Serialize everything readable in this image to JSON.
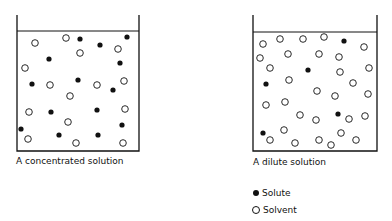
{
  "figure": {
    "beakers": [
      {
        "label": "A concentrated solution",
        "frame": {
          "left": 17,
          "right": 139,
          "top": 15,
          "liquid_top": 31,
          "bottom": 151
        },
        "particles": [
          {
            "x": 35,
            "y": 43,
            "type": "solvent"
          },
          {
            "x": 66,
            "y": 38,
            "type": "solvent"
          },
          {
            "x": 80,
            "y": 39,
            "type": "solute"
          },
          {
            "x": 100,
            "y": 45,
            "type": "solute"
          },
          {
            "x": 127,
            "y": 37,
            "type": "solute"
          },
          {
            "x": 118,
            "y": 49,
            "type": "solvent"
          },
          {
            "x": 80,
            "y": 53,
            "type": "solvent"
          },
          {
            "x": 49,
            "y": 59,
            "type": "solute"
          },
          {
            "x": 120,
            "y": 63,
            "type": "solute"
          },
          {
            "x": 25,
            "y": 68,
            "type": "solvent"
          },
          {
            "x": 32,
            "y": 84,
            "type": "solute"
          },
          {
            "x": 50,
            "y": 85,
            "type": "solvent"
          },
          {
            "x": 78,
            "y": 80,
            "type": "solute"
          },
          {
            "x": 97,
            "y": 85,
            "type": "solvent"
          },
          {
            "x": 113,
            "y": 90,
            "type": "solute"
          },
          {
            "x": 124,
            "y": 81,
            "type": "solvent"
          },
          {
            "x": 70,
            "y": 96,
            "type": "solvent"
          },
          {
            "x": 29,
            "y": 112,
            "type": "solvent"
          },
          {
            "x": 51,
            "y": 112,
            "type": "solute"
          },
          {
            "x": 97,
            "y": 110,
            "type": "solute"
          },
          {
            "x": 125,
            "y": 109,
            "type": "solvent"
          },
          {
            "x": 68,
            "y": 122,
            "type": "solvent"
          },
          {
            "x": 21,
            "y": 129,
            "type": "solute"
          },
          {
            "x": 122,
            "y": 125,
            "type": "solute"
          },
          {
            "x": 28,
            "y": 139,
            "type": "solvent"
          },
          {
            "x": 59,
            "y": 135,
            "type": "solute"
          },
          {
            "x": 76,
            "y": 143,
            "type": "solvent"
          },
          {
            "x": 98,
            "y": 135,
            "type": "solute"
          },
          {
            "x": 123,
            "y": 143,
            "type": "solvent"
          }
        ]
      },
      {
        "label": "A dilute solution",
        "frame": {
          "left": 253,
          "right": 377,
          "top": 15,
          "liquid_top": 32,
          "bottom": 151
        },
        "particles": [
          {
            "x": 263,
            "y": 44,
            "type": "solvent"
          },
          {
            "x": 280,
            "y": 39,
            "type": "solvent"
          },
          {
            "x": 303,
            "y": 39,
            "type": "solvent"
          },
          {
            "x": 324,
            "y": 37,
            "type": "solvent"
          },
          {
            "x": 344,
            "y": 41,
            "type": "solute"
          },
          {
            "x": 364,
            "y": 47,
            "type": "solvent"
          },
          {
            "x": 260,
            "y": 58,
            "type": "solvent"
          },
          {
            "x": 288,
            "y": 54,
            "type": "solvent"
          },
          {
            "x": 319,
            "y": 54,
            "type": "solvent"
          },
          {
            "x": 339,
            "y": 57,
            "type": "solvent"
          },
          {
            "x": 270,
            "y": 68,
            "type": "solvent"
          },
          {
            "x": 308,
            "y": 70,
            "type": "solute"
          },
          {
            "x": 340,
            "y": 72,
            "type": "solvent"
          },
          {
            "x": 369,
            "y": 68,
            "type": "solvent"
          },
          {
            "x": 266,
            "y": 84,
            "type": "solute"
          },
          {
            "x": 289,
            "y": 80,
            "type": "solvent"
          },
          {
            "x": 353,
            "y": 83,
            "type": "solvent"
          },
          {
            "x": 317,
            "y": 91,
            "type": "solvent"
          },
          {
            "x": 335,
            "y": 96,
            "type": "solvent"
          },
          {
            "x": 368,
            "y": 94,
            "type": "solvent"
          },
          {
            "x": 266,
            "y": 105,
            "type": "solvent"
          },
          {
            "x": 285,
            "y": 102,
            "type": "solvent"
          },
          {
            "x": 300,
            "y": 115,
            "type": "solvent"
          },
          {
            "x": 338,
            "y": 114,
            "type": "solute"
          },
          {
            "x": 316,
            "y": 120,
            "type": "solvent"
          },
          {
            "x": 349,
            "y": 119,
            "type": "solvent"
          },
          {
            "x": 365,
            "y": 116,
            "type": "solvent"
          },
          {
            "x": 263,
            "y": 133,
            "type": "solute"
          },
          {
            "x": 284,
            "y": 130,
            "type": "solvent"
          },
          {
            "x": 270,
            "y": 140,
            "type": "solvent"
          },
          {
            "x": 295,
            "y": 143,
            "type": "solvent"
          },
          {
            "x": 319,
            "y": 140,
            "type": "solvent"
          },
          {
            "x": 341,
            "y": 133,
            "type": "solvent"
          },
          {
            "x": 331,
            "y": 145,
            "type": "solvent"
          },
          {
            "x": 356,
            "y": 140,
            "type": "solvent"
          }
        ]
      }
    ],
    "legend": [
      {
        "label": "Solute",
        "symbol": "filled-circle"
      },
      {
        "label": "Solvent",
        "symbol": "open-circle"
      }
    ],
    "colors": {
      "ink": "#111111",
      "background": "#ffffff"
    }
  }
}
